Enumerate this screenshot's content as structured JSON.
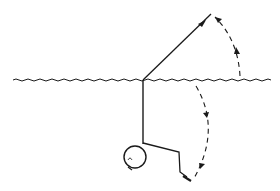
{
  "diagram": {
    "colors": {
      "stroke": "#1a1a1a",
      "background": "#ffffff"
    },
    "elements": [
      {
        "name": "water-surface",
        "type": "wavy-line"
      },
      {
        "name": "upper-line",
        "type": "straight-line-with-arrow"
      },
      {
        "name": "body-line",
        "type": "vertical-line"
      },
      {
        "name": "head",
        "type": "circle"
      },
      {
        "name": "limb",
        "type": "polyline"
      },
      {
        "name": "upper-rotation-arrow",
        "type": "dashed-arc"
      },
      {
        "name": "lower-rotation-arrow",
        "type": "dashed-arc"
      }
    ]
  }
}
